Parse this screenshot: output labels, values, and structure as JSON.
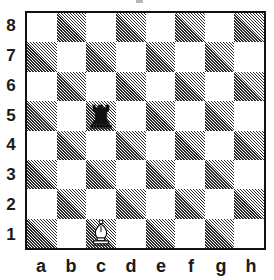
{
  "board": {
    "title": "",
    "orientation": "white",
    "ranks": [
      "8",
      "7",
      "6",
      "5",
      "4",
      "3",
      "2",
      "1"
    ],
    "files": [
      "a",
      "b",
      "c",
      "d",
      "e",
      "f",
      "g",
      "h"
    ],
    "colors": {
      "light_square": "#ffffff",
      "dark_square_hatch": "#2b2b2b",
      "border": "#111111",
      "label_text": "#1a1a1a",
      "black_piece": "#111111",
      "white_piece_fill": "#ffffff",
      "white_piece_outline": "#111111"
    },
    "squares": [
      {
        "square": "a8",
        "shade": "light",
        "piece": null
      },
      {
        "square": "b8",
        "shade": "dark",
        "piece": null
      },
      {
        "square": "c8",
        "shade": "light",
        "piece": null
      },
      {
        "square": "d8",
        "shade": "dark",
        "piece": null
      },
      {
        "square": "e8",
        "shade": "light",
        "piece": null
      },
      {
        "square": "f8",
        "shade": "dark",
        "piece": null
      },
      {
        "square": "g8",
        "shade": "light",
        "piece": null
      },
      {
        "square": "h8",
        "shade": "dark",
        "piece": null
      },
      {
        "square": "a7",
        "shade": "dark",
        "piece": null
      },
      {
        "square": "b7",
        "shade": "light",
        "piece": null
      },
      {
        "square": "c7",
        "shade": "dark",
        "piece": null
      },
      {
        "square": "d7",
        "shade": "light",
        "piece": null
      },
      {
        "square": "e7",
        "shade": "dark",
        "piece": null
      },
      {
        "square": "f7",
        "shade": "light",
        "piece": null
      },
      {
        "square": "g7",
        "shade": "dark",
        "piece": null
      },
      {
        "square": "h7",
        "shade": "light",
        "piece": null
      },
      {
        "square": "a6",
        "shade": "light",
        "piece": null
      },
      {
        "square": "b6",
        "shade": "dark",
        "piece": null
      },
      {
        "square": "c6",
        "shade": "light",
        "piece": null
      },
      {
        "square": "d6",
        "shade": "dark",
        "piece": null
      },
      {
        "square": "e6",
        "shade": "light",
        "piece": null
      },
      {
        "square": "f6",
        "shade": "dark",
        "piece": null
      },
      {
        "square": "g6",
        "shade": "light",
        "piece": null
      },
      {
        "square": "h6",
        "shade": "dark",
        "piece": null
      },
      {
        "square": "a5",
        "shade": "dark",
        "piece": null
      },
      {
        "square": "b5",
        "shade": "light",
        "piece": null
      },
      {
        "square": "c5",
        "shade": "dark",
        "piece": {
          "color": "black",
          "type": "rook",
          "name": "black-rook"
        }
      },
      {
        "square": "d5",
        "shade": "light",
        "piece": null
      },
      {
        "square": "e5",
        "shade": "dark",
        "piece": null
      },
      {
        "square": "f5",
        "shade": "light",
        "piece": null
      },
      {
        "square": "g5",
        "shade": "dark",
        "piece": null
      },
      {
        "square": "h5",
        "shade": "light",
        "piece": null
      },
      {
        "square": "a4",
        "shade": "light",
        "piece": null
      },
      {
        "square": "b4",
        "shade": "dark",
        "piece": null
      },
      {
        "square": "c4",
        "shade": "light",
        "piece": null
      },
      {
        "square": "d4",
        "shade": "dark",
        "piece": null
      },
      {
        "square": "e4",
        "shade": "light",
        "piece": null
      },
      {
        "square": "f4",
        "shade": "dark",
        "piece": null
      },
      {
        "square": "g4",
        "shade": "light",
        "piece": null
      },
      {
        "square": "h4",
        "shade": "dark",
        "piece": null
      },
      {
        "square": "a3",
        "shade": "dark",
        "piece": null
      },
      {
        "square": "b3",
        "shade": "light",
        "piece": null
      },
      {
        "square": "c3",
        "shade": "dark",
        "piece": null
      },
      {
        "square": "d3",
        "shade": "light",
        "piece": null
      },
      {
        "square": "e3",
        "shade": "dark",
        "piece": null
      },
      {
        "square": "f3",
        "shade": "light",
        "piece": null
      },
      {
        "square": "g3",
        "shade": "dark",
        "piece": null
      },
      {
        "square": "h3",
        "shade": "light",
        "piece": null
      },
      {
        "square": "a2",
        "shade": "light",
        "piece": null
      },
      {
        "square": "b2",
        "shade": "dark",
        "piece": null
      },
      {
        "square": "c2",
        "shade": "light",
        "piece": null
      },
      {
        "square": "d2",
        "shade": "dark",
        "piece": null
      },
      {
        "square": "e2",
        "shade": "light",
        "piece": null
      },
      {
        "square": "f2",
        "shade": "dark",
        "piece": null
      },
      {
        "square": "g2",
        "shade": "light",
        "piece": null
      },
      {
        "square": "h2",
        "shade": "dark",
        "piece": null
      },
      {
        "square": "a1",
        "shade": "dark",
        "piece": null
      },
      {
        "square": "b1",
        "shade": "light",
        "piece": null
      },
      {
        "square": "c1",
        "shade": "dark",
        "piece": {
          "color": "white",
          "type": "bishop",
          "name": "white-bishop"
        }
      },
      {
        "square": "d1",
        "shade": "light",
        "piece": null
      },
      {
        "square": "e1",
        "shade": "dark",
        "piece": null
      },
      {
        "square": "f1",
        "shade": "light",
        "piece": null
      },
      {
        "square": "g1",
        "shade": "dark",
        "piece": null
      },
      {
        "square": "h1",
        "shade": "light",
        "piece": null
      }
    ],
    "pieces_on_board": [
      {
        "square": "c5",
        "color": "black",
        "type": "rook"
      },
      {
        "square": "c1",
        "color": "white",
        "type": "bishop"
      }
    ]
  }
}
